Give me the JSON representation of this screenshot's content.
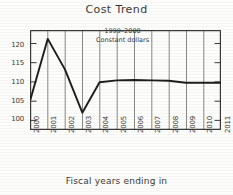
{
  "chart_data": {
    "type": "line",
    "title": "Cost Trend",
    "xlabel": "Fiscal years ending in",
    "ylabel": "",
    "annotation_line1": "1999–2000",
    "annotation_line2": "Constant dollars",
    "categories": [
      "2000",
      "2001",
      "2002",
      "2003",
      "2004",
      "2005",
      "2006",
      "2007",
      "2008",
      "2009",
      "2010",
      "2011"
    ],
    "values": [
      105.5,
      121.2,
      113.2,
      102.0,
      109.9,
      110.4,
      110.5,
      110.4,
      110.3,
      109.8,
      109.8,
      109.8
    ],
    "ytick_labels": [
      "100",
      "105",
      "110",
      "115",
      "120"
    ],
    "ytick_values": [
      100,
      105,
      110,
      115,
      120
    ],
    "ylim": [
      97.5,
      123.5
    ],
    "grid": "vertical",
    "legend": "none",
    "line_color": "#1d1d1b"
  },
  "labels": {
    "title": "Cost Trend",
    "xaxis_caption": "Fiscal years ending in",
    "annotation_1": "1999–2000",
    "annotation_2": "Constant dollars",
    "y_0": "100",
    "y_1": "105",
    "y_2": "110",
    "y_3": "115",
    "y_4": "120",
    "x_0": "2000",
    "x_1": "2001",
    "x_2": "2002",
    "x_3": "2003",
    "x_4": "2004",
    "x_5": "2005",
    "x_6": "2006",
    "x_7": "2007",
    "x_8": "2008",
    "x_9": "2009",
    "x_10": "2010",
    "x_11": "2011"
  }
}
